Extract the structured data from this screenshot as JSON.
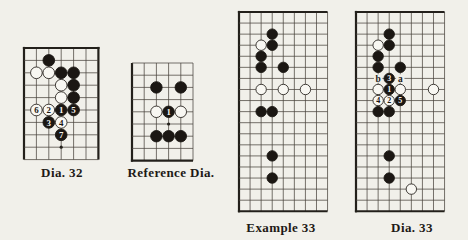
{
  "colors": {
    "page_bg": "#f1f0ea",
    "board_line": "#4a443d",
    "board_edge": "#23201b",
    "black_stone": "#1b1713",
    "white_stone": "#f8f7f2",
    "stone_outline": "#2b2722",
    "star_point": "#23201b",
    "numeral_on_black": "#f6f5f0",
    "numeral_on_white": "#1b1713",
    "letter_ink": "#23201b",
    "label_ink": "#1e1a16"
  },
  "diagrams": [
    {
      "id": "dia-32",
      "label": "Dia. 32",
      "label_pos": {
        "x": 62,
        "y": 165
      },
      "board": {
        "x": 24,
        "y": 47.5,
        "cols": 7,
        "rows": 10,
        "cell": 12.4,
        "edges": {
          "left": true,
          "top": true,
          "right": true,
          "bottom": false
        },
        "stones": [
          {
            "c": 2,
            "r": 1,
            "k": "b"
          },
          {
            "c": 1,
            "r": 2,
            "k": "w"
          },
          {
            "c": 2,
            "r": 2,
            "k": "w"
          },
          {
            "c": 3,
            "r": 2,
            "k": "b"
          },
          {
            "c": 4,
            "r": 2,
            "k": "b"
          },
          {
            "c": 3,
            "r": 3,
            "k": "w"
          },
          {
            "c": 4,
            "r": 3,
            "k": "b"
          },
          {
            "c": 3,
            "r": 4,
            "k": "w"
          },
          {
            "c": 4,
            "r": 4,
            "k": "b"
          },
          {
            "c": 1,
            "r": 5,
            "k": "w",
            "n": "6"
          },
          {
            "c": 2,
            "r": 5,
            "k": "w",
            "n": "2"
          },
          {
            "c": 3,
            "r": 5,
            "k": "b",
            "n": "1"
          },
          {
            "c": 4,
            "r": 5,
            "k": "b",
            "n": "5"
          },
          {
            "c": 2,
            "r": 6,
            "k": "b",
            "n": "3"
          },
          {
            "c": 3,
            "r": 6,
            "k": "w",
            "n": "4"
          },
          {
            "c": 3,
            "r": 7,
            "k": "b",
            "n": "7"
          }
        ],
        "stars": [
          {
            "c": 3,
            "r": 8
          }
        ],
        "letters": []
      }
    },
    {
      "id": "reference-dia",
      "label": "Reference Dia.",
      "label_pos": {
        "x": 171,
        "y": 165
      },
      "board": {
        "x": 132,
        "y": 62.5,
        "cols": 6,
        "rows": 9,
        "cell": 12.2,
        "edges": {
          "left": true,
          "top": false,
          "right": false,
          "bottom": true
        },
        "stones": [
          {
            "c": 2,
            "r": 2,
            "k": "b"
          },
          {
            "c": 4,
            "r": 2,
            "k": "b"
          },
          {
            "c": 2,
            "r": 4,
            "k": "w"
          },
          {
            "c": 3,
            "r": 4,
            "k": "b",
            "n": "1"
          },
          {
            "c": 4,
            "r": 4,
            "k": "w"
          },
          {
            "c": 2,
            "r": 6,
            "k": "b"
          },
          {
            "c": 3,
            "r": 6,
            "k": "b"
          },
          {
            "c": 4,
            "r": 6,
            "k": "b"
          }
        ],
        "stars": [
          {
            "c": 3,
            "r": 5
          }
        ],
        "letters": []
      }
    },
    {
      "id": "example-33",
      "label": "Example 33",
      "label_pos": {
        "x": 281,
        "y": 220
      },
      "board": {
        "x": 238.5,
        "y": 11.5,
        "cols": 9,
        "rows": 19,
        "cell": 11.07,
        "edges": {
          "left": true,
          "top": true,
          "right": false,
          "bottom": true
        },
        "stones": [
          {
            "c": 3,
            "r": 2,
            "k": "b"
          },
          {
            "c": 2,
            "r": 3,
            "k": "w"
          },
          {
            "c": 3,
            "r": 3,
            "k": "b"
          },
          {
            "c": 2,
            "r": 4,
            "k": "b"
          },
          {
            "c": 2,
            "r": 5,
            "k": "b"
          },
          {
            "c": 4,
            "r": 5,
            "k": "b"
          },
          {
            "c": 2,
            "r": 7,
            "k": "w"
          },
          {
            "c": 4,
            "r": 7,
            "k": "w"
          },
          {
            "c": 6,
            "r": 7,
            "k": "w"
          },
          {
            "c": 2,
            "r": 9,
            "k": "b"
          },
          {
            "c": 3,
            "r": 9,
            "k": "b"
          },
          {
            "c": 3,
            "r": 13,
            "k": "b"
          },
          {
            "c": 3,
            "r": 15,
            "k": "b"
          }
        ],
        "stars": [],
        "letters": []
      }
    },
    {
      "id": "dia-33",
      "label": "Dia. 33",
      "label_pos": {
        "x": 412,
        "y": 220
      },
      "board": {
        "x": 355.5,
        "y": 11.5,
        "cols": 9,
        "rows": 19,
        "cell": 11.07,
        "edges": {
          "left": true,
          "top": true,
          "right": false,
          "bottom": true
        },
        "stones": [
          {
            "c": 3,
            "r": 2,
            "k": "b"
          },
          {
            "c": 2,
            "r": 3,
            "k": "w"
          },
          {
            "c": 3,
            "r": 3,
            "k": "b"
          },
          {
            "c": 2,
            "r": 4,
            "k": "b"
          },
          {
            "c": 2,
            "r": 5,
            "k": "b"
          },
          {
            "c": 4,
            "r": 5,
            "k": "b"
          },
          {
            "c": 3,
            "r": 6,
            "k": "b",
            "n": "3"
          },
          {
            "c": 2,
            "r": 7,
            "k": "w"
          },
          {
            "c": 3,
            "r": 7,
            "k": "b",
            "n": "1"
          },
          {
            "c": 4,
            "r": 7,
            "k": "w"
          },
          {
            "c": 7,
            "r": 7,
            "k": "w"
          },
          {
            "c": 2,
            "r": 8,
            "k": "w",
            "n": "4"
          },
          {
            "c": 3,
            "r": 8,
            "k": "w",
            "n": "2"
          },
          {
            "c": 4,
            "r": 8,
            "k": "b",
            "n": "5"
          },
          {
            "c": 2,
            "r": 9,
            "k": "b"
          },
          {
            "c": 3,
            "r": 9,
            "k": "b"
          },
          {
            "c": 3,
            "r": 13,
            "k": "b"
          },
          {
            "c": 3,
            "r": 15,
            "k": "b"
          },
          {
            "c": 5,
            "r": 16,
            "k": "w"
          }
        ],
        "stars": [],
        "letters": [
          {
            "c": 2,
            "r": 6,
            "t": "b"
          },
          {
            "c": 4,
            "r": 6,
            "t": "a"
          }
        ]
      }
    }
  ]
}
